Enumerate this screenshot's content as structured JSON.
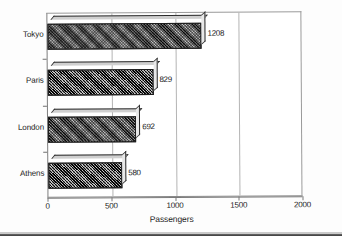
{
  "chart_data": {
    "type": "bar",
    "orientation": "horizontal",
    "title": "",
    "xlabel": "Passengers",
    "ylabel": "",
    "categories": [
      "Tokyo",
      "Paris",
      "London",
      "Athens"
    ],
    "values": [
      1208,
      829,
      692,
      580
    ],
    "value_labels": [
      "1208",
      "829",
      "692",
      "580"
    ],
    "xlim": [
      0,
      2000
    ],
    "xticks": [
      0,
      500,
      1000,
      1500,
      2000
    ],
    "xtick_labels": [
      "0",
      "500",
      "1000",
      "1500",
      "2000"
    ],
    "grid": "vertical",
    "legend": "none",
    "series": [
      {
        "name": "Passengers",
        "values": [
          1208,
          829,
          692,
          580
        ]
      }
    ],
    "style": {
      "bar_fill": "crosshatch",
      "bar_color": "#3a3a3a",
      "bar_edge_color": "#1c1c1c",
      "highlight_face_color": "#e8e8e8",
      "gridline_color": "#b4b4b4",
      "frame_color": "#9a9a9a",
      "text_color": "#1f1f1f",
      "background": "#ffffff"
    }
  }
}
